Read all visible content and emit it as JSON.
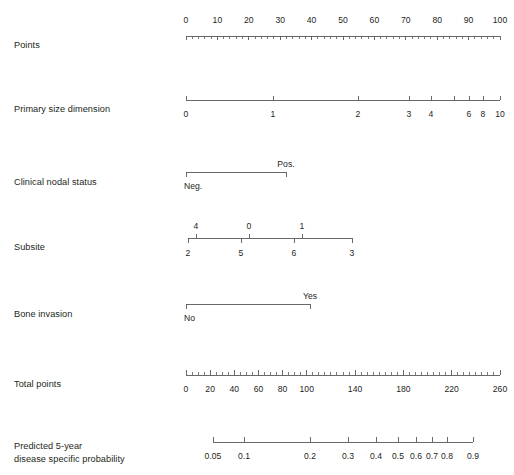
{
  "figure": {
    "type": "nomogram",
    "background": "#ffffff",
    "line_color": "#58595b",
    "text_color": "#231f20",
    "width": 514,
    "height": 475
  },
  "rows": [
    {
      "id": "points",
      "label": "Points",
      "label_x": 14,
      "label_y": 39,
      "axis": {
        "x_start": 186,
        "x_end": 500,
        "y": 36,
        "tick_direction": "down",
        "tick_length": 4,
        "minor_tick_length": 2.5,
        "domain_min": 0,
        "domain_max": 100,
        "label_side": "above",
        "label_offset": 13,
        "major_ticks": [
          0,
          10,
          20,
          30,
          40,
          50,
          60,
          70,
          80,
          90,
          100
        ],
        "major_labels": [
          "0",
          "10",
          "20",
          "30",
          "40",
          "50",
          "60",
          "70",
          "80",
          "90",
          "100"
        ],
        "minor_ticks": [
          2,
          4,
          6,
          8,
          12,
          14,
          16,
          18,
          22,
          24,
          26,
          28,
          32,
          34,
          36,
          38,
          42,
          44,
          46,
          48,
          52,
          54,
          56,
          58,
          62,
          64,
          66,
          68,
          72,
          74,
          76,
          78,
          82,
          84,
          86,
          88,
          92,
          94,
          96,
          98
        ]
      }
    },
    {
      "id": "primary-size-dimension",
      "label": "Primary size dimension",
      "label_x": 14,
      "label_y": 103,
      "axis": {
        "x_start": 186,
        "x_end": 500,
        "y": 100,
        "tick_direction": "up",
        "tick_length": 4.5,
        "minor_tick_length": 4.5,
        "label_side": "below",
        "label_offset": 11,
        "positions": [
          186,
          273,
          358,
          409,
          431,
          454,
          469,
          483,
          500
        ],
        "labels": [
          "0",
          "1",
          "2",
          "3",
          "4",
          "",
          "6",
          "8",
          "10"
        ],
        "values": [
          0,
          1,
          2,
          3,
          4,
          5,
          6,
          8,
          10
        ]
      }
    },
    {
      "id": "clinical-nodal-status",
      "label": "Clinical nodal status",
      "label_x": 14,
      "label_y": 176,
      "axis": {
        "x_start": 186,
        "x_end": 286,
        "y": 172,
        "tick_direction": "down",
        "tick_length": 5,
        "points": [
          {
            "x": 186,
            "label": "Neg.",
            "label_side": "below",
            "label_offset": 11,
            "align": "left"
          },
          {
            "x": 286,
            "label": "Pos.",
            "label_side": "above",
            "label_offset": 5,
            "align": "center"
          }
        ]
      }
    },
    {
      "id": "subsite",
      "label": "Subsite",
      "label_x": 14,
      "label_y": 241,
      "axis": {
        "x_start": 188,
        "x_end": 352,
        "y": 238,
        "tick_length": 4.5,
        "ticks_above": [
          {
            "x": 196,
            "label": "4"
          },
          {
            "x": 249,
            "label": "0"
          },
          {
            "x": 302,
            "label": "1"
          }
        ],
        "ticks_below": [
          {
            "x": 188,
            "label": "2"
          },
          {
            "x": 241,
            "label": "5"
          },
          {
            "x": 294,
            "label": "6"
          },
          {
            "x": 352,
            "label": "3"
          }
        ],
        "label_offset_above": 7,
        "label_offset_below": 11
      }
    },
    {
      "id": "bone-invasion",
      "label": "Bone invasion",
      "label_x": 14,
      "label_y": 308,
      "axis": {
        "x_start": 186,
        "x_end": 310,
        "y": 304,
        "tick_direction": "down",
        "tick_length": 5,
        "points": [
          {
            "x": 186,
            "label": "No",
            "label_side": "below",
            "label_offset": 11,
            "align": "left"
          },
          {
            "x": 310,
            "label": "Yes",
            "label_side": "above",
            "label_offset": 5,
            "align": "center"
          }
        ]
      }
    },
    {
      "id": "total-points",
      "label": "Total points",
      "label_x": 14,
      "label_y": 378,
      "axis": {
        "x_start": 186,
        "x_end": 500,
        "y": 375,
        "tick_direction": "up",
        "tick_length": 5,
        "minor_tick_length": 3,
        "domain_min": 0,
        "domain_max": 260,
        "label_side": "below",
        "label_offset": 11,
        "major_ticks": [
          0,
          20,
          40,
          60,
          80,
          100,
          140,
          180,
          220,
          260
        ],
        "major_labels": [
          "0",
          "20",
          "40",
          "60",
          "80",
          "100",
          "140",
          "180",
          "220",
          "260"
        ],
        "minor_step": 5
      }
    },
    {
      "id": "predicted-probability",
      "label": "Predicted 5-year\ndisease specific probability",
      "label_x": 14,
      "label_y": 440,
      "axis": {
        "x_start": 213,
        "x_end": 473,
        "y": 442,
        "tick_direction": "up",
        "tick_length": 5,
        "label_side": "below",
        "label_offset": 11,
        "positions": [
          213,
          244,
          310,
          348,
          376,
          398,
          416,
          432,
          447,
          473
        ],
        "labels": [
          "0.05",
          "0.1",
          "0.2",
          "0.3",
          "0.4",
          "0.5",
          "0.6",
          "0.7",
          "0.8",
          "0.9"
        ],
        "values": [
          0.05,
          0.1,
          0.2,
          0.3,
          0.4,
          0.5,
          0.6,
          0.7,
          0.8,
          0.9
        ]
      }
    }
  ],
  "chart_data": {
    "type": "nomogram",
    "title": "",
    "scales": [
      {
        "name": "Points",
        "min": 0,
        "max": 100,
        "ticks": [
          0,
          10,
          20,
          30,
          40,
          50,
          60,
          70,
          80,
          90,
          100
        ]
      },
      {
        "name": "Primary size dimension",
        "ticks": [
          0,
          1,
          2,
          3,
          4,
          6,
          8,
          10
        ]
      },
      {
        "name": "Clinical nodal status",
        "categories": [
          "Neg.",
          "Pos."
        ]
      },
      {
        "name": "Subsite",
        "categories_above": [
          "4",
          "0",
          "1"
        ],
        "categories_below": [
          "2",
          "5",
          "6",
          "3"
        ]
      },
      {
        "name": "Bone invasion",
        "categories": [
          "No",
          "Yes"
        ]
      },
      {
        "name": "Total points",
        "min": 0,
        "max": 260,
        "ticks": [
          0,
          20,
          40,
          60,
          80,
          100,
          140,
          180,
          220,
          260
        ]
      },
      {
        "name": "Predicted 5-year disease specific probability",
        "ticks": [
          0.05,
          0.1,
          0.2,
          0.3,
          0.4,
          0.5,
          0.6,
          0.7,
          0.8,
          0.9
        ]
      }
    ]
  }
}
